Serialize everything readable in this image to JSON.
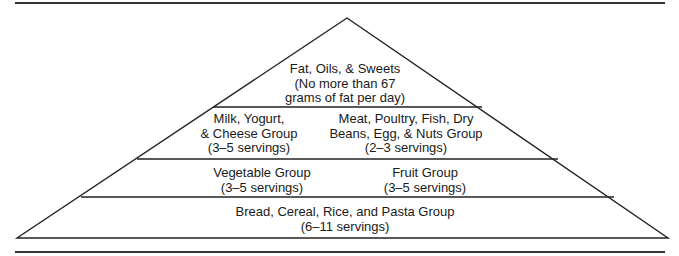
{
  "tiers": [
    {
      "level": "top",
      "groups": [
        {
          "id": "fats-oils-sweets",
          "lines": [
            "Fat, Oils, & Sweets",
            "(No more than 67",
            "grams of fat per day)"
          ]
        }
      ]
    },
    {
      "level": "second",
      "groups": [
        {
          "id": "milk-yogurt-cheese",
          "lines": [
            "Milk, Yogurt,",
            "& Cheese Group",
            "(3–5 servings)"
          ]
        },
        {
          "id": "meat-poultry-fish-beans-egg-nuts",
          "lines": [
            "Meat, Poultry, Fish, Dry",
            "Beans, Egg, & Nuts Group",
            "(2–3 servings)"
          ]
        }
      ]
    },
    {
      "level": "third",
      "groups": [
        {
          "id": "vegetable",
          "lines": [
            "Vegetable Group",
            "(3–5 servings)"
          ]
        },
        {
          "id": "fruit",
          "lines": [
            "Fruit Group",
            "(3–5 servings)"
          ]
        }
      ]
    },
    {
      "level": "base",
      "groups": [
        {
          "id": "bread-cereal-rice-pasta",
          "lines": [
            "Bread, Cereal, Rice, and Pasta Group",
            "(6–11 servings)"
          ]
        }
      ]
    }
  ],
  "colors": {
    "line": "#222222",
    "rule": "#333333",
    "text": "#1a1a1a",
    "background": "#ffffff"
  }
}
